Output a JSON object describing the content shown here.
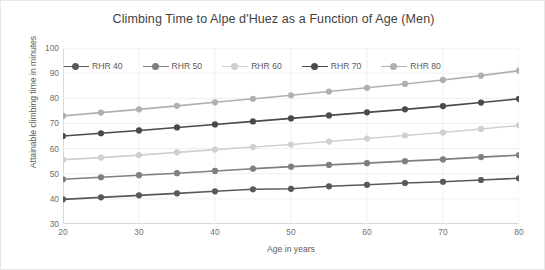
{
  "chart_data": {
    "type": "line",
    "title": "Climbing Time to Alpe d'Huez as a Function of Age (Men)",
    "xlabel": "Age in years",
    "ylabel": "Attainable climbing time in minutes",
    "x": [
      20,
      25,
      30,
      35,
      40,
      45,
      50,
      55,
      60,
      65,
      70,
      75,
      80
    ],
    "xlim": [
      20,
      80
    ],
    "ylim": [
      30,
      100
    ],
    "xticks": [
      20,
      30,
      40,
      50,
      60,
      70,
      80
    ],
    "yticks": [
      30,
      40,
      50,
      60,
      70,
      80,
      90,
      100
    ],
    "grid": true,
    "legend_position": "top",
    "series": [
      {
        "name": "RHR 40",
        "color": "#595959",
        "values": [
          39.8,
          40.6,
          41.4,
          42.2,
          43.0,
          43.8,
          44.0,
          45.0,
          45.6,
          46.3,
          46.8,
          47.5,
          48.2
        ]
      },
      {
        "name": "RHR 50",
        "color": "#7f7f7f",
        "values": [
          47.8,
          48.6,
          49.4,
          50.2,
          51.1,
          52.0,
          52.8,
          53.5,
          54.2,
          55.0,
          55.7,
          56.6,
          57.4
        ]
      },
      {
        "name": "RHR 60",
        "color": "#d0d0d0",
        "values": [
          55.6,
          56.4,
          57.4,
          58.5,
          59.6,
          60.6,
          61.6,
          62.8,
          64.0,
          65.2,
          66.4,
          67.8,
          69.2
        ]
      },
      {
        "name": "RHR 70",
        "color": "#4a4a4a",
        "values": [
          65.0,
          66.1,
          67.2,
          68.4,
          69.6,
          70.8,
          72.0,
          73.2,
          74.4,
          75.6,
          76.9,
          78.3,
          79.8
        ]
      },
      {
        "name": "RHR 80",
        "color": "#b0b0b0",
        "values": [
          73.0,
          74.3,
          75.6,
          77.0,
          78.4,
          79.8,
          81.2,
          82.7,
          84.2,
          85.7,
          87.3,
          89.0,
          91.0
        ]
      }
    ]
  }
}
